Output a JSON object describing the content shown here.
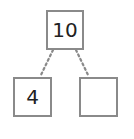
{
  "number_bond": {
    "whole": {
      "value": "10"
    },
    "parts": [
      {
        "value": "4"
      },
      {
        "value": ""
      }
    ]
  },
  "colors": {
    "border": "#8a8a8a",
    "connector": "#8a8a8a",
    "text": "#222222",
    "background": "#ffffff"
  }
}
